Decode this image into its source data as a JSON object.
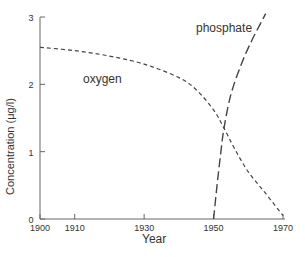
{
  "chart_data": {
    "type": "line",
    "title": "",
    "xlabel": "Year",
    "ylabel": "Concentration (μg/l)",
    "xlim": [
      1900,
      1970
    ],
    "ylim": [
      0,
      3
    ],
    "xticks": [
      1900,
      1910,
      1930,
      1950,
      1970
    ],
    "yticks": [
      0,
      1,
      2,
      3
    ],
    "grid": false,
    "legend": "inline labels",
    "series": [
      {
        "name": "oxygen",
        "style": "dashed (short)",
        "x": [
          1900,
          1910,
          1920,
          1930,
          1940,
          1945,
          1950,
          1953,
          1956,
          1960,
          1965,
          1970
        ],
        "y": [
          2.55,
          2.5,
          2.42,
          2.3,
          2.1,
          1.92,
          1.62,
          1.35,
          1.05,
          0.7,
          0.38,
          0.05
        ]
      },
      {
        "name": "phosphate",
        "style": "dashed (long)",
        "x": [
          1950,
          1951,
          1952,
          1953,
          1955,
          1958,
          1961,
          1964,
          1965
        ],
        "y": [
          0,
          0.5,
          0.95,
          1.35,
          1.85,
          2.3,
          2.65,
          2.95,
          3.05
        ]
      }
    ]
  },
  "labels": {
    "oxygen": "oxygen",
    "phosphate": "phosphate",
    "xlabel": "Year",
    "ylabel": "Concentration (μg/l)"
  },
  "ticks": {
    "x": [
      "1900",
      "1910",
      "1930",
      "1950",
      "1970"
    ],
    "y": [
      "0",
      "1",
      "2",
      "3"
    ]
  }
}
